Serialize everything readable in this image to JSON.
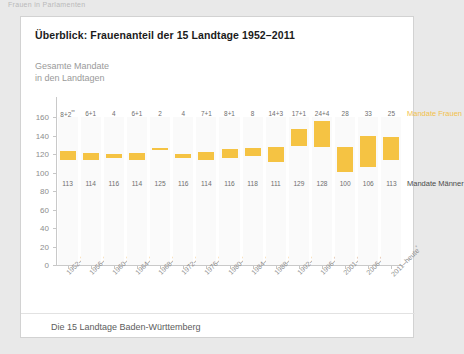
{
  "page": {
    "running_header": "Frauen in Parlamenten"
  },
  "card": {
    "title": "Überblick: Frauenanteil der 15 Landtage 1952–2011",
    "axis_caption_line1": "Gesamte Mandate",
    "axis_caption_line2": "in den Landtagen",
    "footer": "Die 15 Landtage Baden-Württemberg",
    "legend_women": "Mandate Frauen",
    "legend_men": "Mandate Männer"
  },
  "chart_data": {
    "type": "bar",
    "title": "Überblick: Frauenanteil der 15 Landtage 1952–2011",
    "xlabel": "",
    "ylabel": "Gesamte Mandate in den Landtagen",
    "ylim": [
      0,
      160
    ],
    "yticks": [
      0,
      20,
      40,
      60,
      80,
      100,
      120,
      140,
      160
    ],
    "grid": false,
    "legend_position": "right",
    "categories": [
      "1952–1956",
      "1956–1960",
      "1960–1964",
      "1964–1968",
      "1968–1972",
      "1972–1976",
      "1976–1980",
      "1980–1984",
      "1984–1988",
      "1988–1992",
      "1992–1996",
      "1996–2001",
      "2001–2006",
      "2006–2011",
      "2011–heute"
    ],
    "category_notes": [
      "",
      "",
      "",
      "",
      "",
      "",
      "",
      "",
      "",
      "",
      "",
      "",
      "",
      "",
      "*"
    ],
    "women_labels": [
      "8+2",
      "6+1",
      "4",
      "6+1",
      "2",
      "4",
      "7+1",
      "8+1",
      "8",
      "14+3",
      "17+1",
      "24+4",
      "28",
      "33",
      "25"
    ],
    "women_label_notes": [
      "**",
      "",
      "",
      "",
      "",
      "",
      "",
      "",
      "",
      "",
      "",
      "",
      "",
      "",
      ""
    ],
    "series": [
      {
        "name": "Mandate Männer",
        "values": [
          113,
          114,
          116,
          114,
          125,
          116,
          114,
          116,
          118,
          111,
          129,
          128,
          100,
          106,
          113
        ]
      },
      {
        "name": "Mandate Frauen",
        "values": [
          10,
          7,
          4,
          7,
          2,
          4,
          8,
          9,
          8,
          17,
          18,
          28,
          28,
          33,
          25
        ]
      }
    ],
    "totals": [
      123,
      121,
      120,
      121,
      127,
      120,
      122,
      125,
      126,
      128,
      147,
      156,
      128,
      139,
      138
    ]
  }
}
